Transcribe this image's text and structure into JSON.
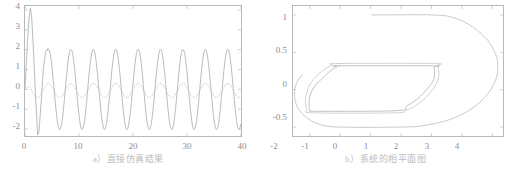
{
  "figure": {
    "panels": [
      {
        "id": "a",
        "caption": "a）直接仿真结果",
        "chart_data": {
          "type": "line",
          "title": "",
          "xlabel": "",
          "ylabel": "",
          "xlim": [
            0,
            40
          ],
          "ylim": [
            -2.35,
            4.2
          ],
          "grid": false,
          "legend": "none",
          "xticks": [
            0,
            10,
            20,
            30,
            40
          ],
          "xtick_labels": [
            "0",
            "10",
            "20",
            "30",
            "40"
          ],
          "yticks": [
            -2,
            -1,
            0,
            1,
            2,
            3,
            4
          ],
          "ytick_labels": [
            "-2",
            "-1",
            "0",
            "1",
            "2",
            "3",
            "4"
          ],
          "series": [
            {
              "name": "output",
              "style": "solid",
              "color": "#a9a9a9",
              "description": "initial overshoot to 4 at t=1, undershoot to -2.3 at t=2.4, then steady sinusoidal limit cycle amplitude 2, period 4.15",
              "transient_points": [
                [
                  0.0,
                  0.0
                ],
                [
                  0.45,
                  2.4
                ],
                [
                  0.75,
                  3.6
                ],
                [
                  1.0,
                  4.1
                ],
                [
                  1.25,
                  3.6
                ],
                [
                  1.6,
                  1.8
                ],
                [
                  2.0,
                  -0.6
                ],
                [
                  2.35,
                  -2.3
                ],
                [
                  2.6,
                  -2.1
                ],
                [
                  3.0,
                  -0.6
                ],
                [
                  3.4,
                  1.0
                ],
                [
                  3.8,
                  1.9
                ],
                [
                  4.2,
                  2.05
                ]
              ],
              "steady_amplitude": 2.02,
              "steady_period": 4.15,
              "steady_start_time": 4.2,
              "steady_peak_time": 4.35
            },
            {
              "name": "estimate",
              "style": "dotted",
              "color": "#c3c3c3",
              "description": "low amplitude dotted oscillation between -0.42 and 0.30, same period as output",
              "steady_high": 0.3,
              "steady_low": -0.42,
              "steady_period": 4.15,
              "steady_peak_time": 4.35
            }
          ]
        }
      },
      {
        "id": "b",
        "caption": "b）系统的相平面图",
        "chart_data": {
          "type": "line",
          "title": "",
          "xlabel": "",
          "ylabel": "",
          "xlim": [
            -2.55,
            4.35
          ],
          "ylim": [
            -0.62,
            1.12
          ],
          "grid": false,
          "legend": "none",
          "xticks": [
            -2,
            -1,
            0,
            1,
            2,
            3,
            4
          ],
          "xtick_labels": [
            "-2",
            "-1",
            "0",
            "1",
            "2",
            "3",
            "4"
          ],
          "yticks": [
            -0.5,
            0,
            0.5,
            1
          ],
          "ytick_labels": [
            "-0.5",
            "0",
            "0.5",
            "1"
          ],
          "series": [
            {
              "name": "outer-transient-orbit",
              "style": "solid",
              "color": "#bcbcbc",
              "points": [
                [
                  0.05,
                  1.0
                ],
                [
                  2.05,
                  1.0
                ],
                [
                  2.75,
                  0.96
                ],
                [
                  3.35,
                  0.84
                ],
                [
                  3.85,
                  0.66
                ],
                [
                  4.12,
                  0.46
                ],
                [
                  4.18,
                  0.3
                ],
                [
                  4.1,
                  0.12
                ],
                [
                  3.8,
                  -0.08
                ],
                [
                  3.3,
                  -0.26
                ],
                [
                  2.6,
                  -0.4
                ],
                [
                  1.75,
                  -0.48
                ],
                [
                  1.0,
                  -0.5
                ],
                [
                  -1.05,
                  -0.5
                ],
                [
                  -1.7,
                  -0.46
                ],
                [
                  -2.15,
                  -0.36
                ],
                [
                  -2.42,
                  -0.22
                ],
                [
                  -2.5,
                  -0.06
                ],
                [
                  -2.44,
                  0.08
                ],
                [
                  -2.25,
                  0.2
                ]
              ]
            },
            {
              "name": "inner-limit-cycle",
              "style": "solid",
              "color": "#b0b0b0",
              "points": [
                [
                  -1.02,
                  0.32
                ],
                [
                  2.02,
                  0.32
                ],
                [
                  2.08,
                  0.3
                ],
                [
                  2.1,
                  0.22
                ],
                [
                  2.06,
                  0.12
                ],
                [
                  1.88,
                  0.02
                ],
                [
                  1.55,
                  -0.12
                ],
                [
                  1.18,
                  -0.22
                ],
                [
                  0.88,
                  -0.28
                ],
                [
                  -1.72,
                  -0.29
                ],
                [
                  -1.98,
                  -0.28
                ],
                [
                  -2.02,
                  -0.22
                ],
                [
                  -2.0,
                  -0.1
                ],
                [
                  -1.88,
                  0.02
                ],
                [
                  -1.62,
                  0.14
                ],
                [
                  -1.32,
                  0.25
                ],
                [
                  -1.1,
                  0.31
                ]
              ]
            },
            {
              "name": "inner-secondary-loop",
              "style": "solid",
              "color": "#c6c6c6",
              "points": [
                [
                  -1.05,
                  0.35
                ],
                [
                  2.06,
                  0.35
                ],
                [
                  2.18,
                  0.32
                ],
                [
                  2.24,
                  0.24
                ],
                [
                  2.2,
                  0.12
                ],
                [
                  2.0,
                  -0.02
                ],
                [
                  1.6,
                  -0.18
                ],
                [
                  1.15,
                  -0.28
                ],
                [
                  0.8,
                  -0.31
                ],
                [
                  -1.88,
                  -0.31
                ],
                [
                  -2.08,
                  -0.27
                ],
                [
                  -2.14,
                  -0.18
                ],
                [
                  -2.1,
                  -0.04
                ],
                [
                  -1.95,
                  0.1
                ],
                [
                  -1.62,
                  0.24
                ],
                [
                  -1.28,
                  0.33
                ]
              ]
            }
          ]
        }
      }
    ]
  }
}
